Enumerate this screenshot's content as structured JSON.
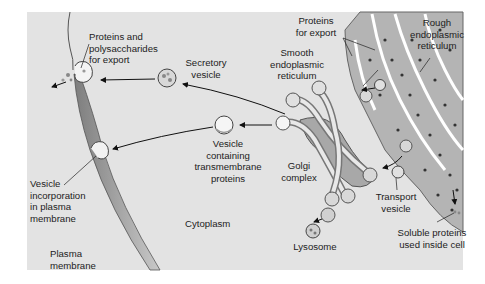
{
  "figure": {
    "colors": {
      "background": "#e3e3e3",
      "membrane": "#9a9a9a",
      "organelle_fill": "#b0b0b0",
      "lumen": "#ffffff",
      "ribosome": "#3a3a3a",
      "text": "#1c1c1c"
    }
  },
  "labels": {
    "proteins_polysaccharides": "Proteins and\npolysaccharides\nfor export",
    "secretory_vesicle": "Secretory\nvesicle",
    "proteins_for_export": "Proteins\nfor export",
    "rough_er": "Rough\nendoplasmic\nreticulum",
    "smooth_er": "Smooth\nendoplasmic\nreticulum",
    "vesicle_transmembrane": "Vesicle\ncontaining\ntransmembrane\nproteins",
    "golgi_complex": "Golgi\ncomplex",
    "vesicle_incorporation": "Vesicle\nincorporation\nin plasma\nmembrane",
    "transport_vesicle": "Transport\nvesicle",
    "cytoplasm": "Cytoplasm",
    "lysosome": "Lysosome",
    "soluble_proteins": "Soluble proteins\nused inside cell",
    "plasma_membrane": "Plasma\nmembrane"
  },
  "pathways": [
    {
      "from": "Golgi complex",
      "to": "Secretory vesicle"
    },
    {
      "from": "Secretory vesicle",
      "to": "Plasma membrane (export)"
    },
    {
      "from": "Golgi complex",
      "to": "Vesicle containing transmembrane proteins"
    },
    {
      "from": "Vesicle containing transmembrane proteins",
      "to": "Vesicle incorporation in plasma membrane"
    },
    {
      "from": "Golgi complex",
      "to": "Lysosome"
    },
    {
      "from": "Rough endoplasmic reticulum",
      "to": "Transport vesicle"
    },
    {
      "from": "Transport vesicle",
      "to": "Golgi complex"
    },
    {
      "from": "Rough endoplasmic reticulum",
      "to": "Soluble proteins used inside cell"
    }
  ]
}
